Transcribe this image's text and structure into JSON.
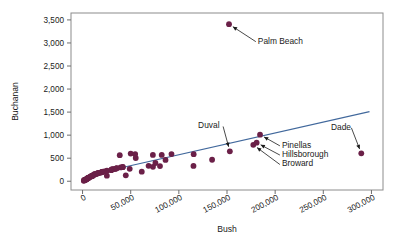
{
  "chart": {
    "type": "scatter",
    "title": "",
    "colors": {
      "point": "#6b2048",
      "trendline": "#41689c",
      "frame": "#8c8c8c",
      "text": "#1a1a1a",
      "background": "#ffffff"
    }
  },
  "chart_data": {
    "type": "scatter",
    "title": "",
    "xlabel": "Bush",
    "ylabel": "Buchanan",
    "xlim": [
      -12000,
      312000
    ],
    "ylim": [
      -190,
      3650
    ],
    "grid": false,
    "legend": null,
    "xticks": [
      0,
      50000,
      100000,
      150000,
      200000,
      250000,
      300000
    ],
    "xtick_labels": [
      "0",
      "50,000",
      "100,000",
      "150,000",
      "200,000",
      "250,000",
      "300,000"
    ],
    "yticks": [
      0,
      500,
      1000,
      1500,
      2000,
      2500,
      3000,
      3500
    ],
    "ytick_labels": [
      "0",
      "500",
      "1,000",
      "1,500",
      "2,000",
      "2,500",
      "3,000",
      "3,500"
    ],
    "series": [
      {
        "name": "Florida counties",
        "marker": "circle",
        "color": "#6b2048",
        "x": [
          1316,
          1407,
          2153,
          2873,
          3038,
          3300,
          3764,
          4051,
          4256,
          4512,
          4985,
          5058,
          5414,
          5610,
          6060,
          6443,
          7244,
          8177,
          8350,
          9138,
          9893,
          10006,
          10776,
          11249,
          12173,
          12176,
          12463,
          13439,
          14630,
          15196,
          16059,
          16404,
          17233,
          18850,
          19769,
          20196,
          20736,
          21271,
          23160,
          25249,
          25309,
          29744,
          29765,
          30400,
          31045,
          32644,
          34124,
          34705,
          35419,
          35426,
          38637,
          39497,
          41745,
          41774,
          44896,
          48969,
          50010,
          54647,
          55229,
          61483,
          68582,
          73029,
          73126,
          75677,
          80416,
          82214,
          86145,
          92359,
          115185,
          115396,
          134530,
          152082,
          152951,
          177323,
          180760,
          184312,
          289456
        ],
        "y": [
          9,
          22,
          29,
          27,
          35,
          36,
          41,
          46,
          52,
          48,
          57,
          60,
          65,
          70,
          73,
          78,
          90,
          95,
          105,
          108,
          120,
          111,
          126,
          133,
          145,
          150,
          155,
          152,
          162,
          168,
          175,
          180,
          182,
          188,
          195,
          200,
          205,
          210,
          215,
          120,
          228,
          240,
          248,
          255,
          260,
          265,
          270,
          275,
          280,
          285,
          565,
          300,
          305,
          310,
          128,
          270,
          600,
          590,
          504,
          208,
          335,
          570,
          312,
          396,
          330,
          570,
          462,
          590,
          333,
          588,
          466,
          3407,
          650,
          789,
          836,
          1010,
          605
        ]
      }
    ],
    "trendline": {
      "label": "least-squares fit",
      "color": "#41689c",
      "x": [
        38000,
        298000
      ],
      "y": [
        280,
        1510
      ]
    },
    "annotations": [
      {
        "label": "Palm Beach",
        "point_x": 152082,
        "point_y": 3407,
        "text_x": 182000,
        "text_y": 3050,
        "anchor": "start"
      },
      {
        "label": "Duval",
        "point_x": 152951,
        "point_y": 650,
        "text_x": 120000,
        "text_y": 1210,
        "anchor": "start"
      },
      {
        "label": "Pinellas",
        "point_x": 184312,
        "point_y": 1010,
        "text_x": 207000,
        "text_y": 790,
        "anchor": "start"
      },
      {
        "label": "Hillsborough",
        "point_x": 180760,
        "point_y": 836,
        "text_x": 207000,
        "text_y": 590,
        "anchor": "start"
      },
      {
        "label": "Broward",
        "point_x": 177323,
        "point_y": 789,
        "text_x": 207000,
        "text_y": 385,
        "anchor": "start"
      },
      {
        "label": "Dade",
        "point_x": 289456,
        "point_y": 605,
        "text_x": 258000,
        "text_y": 1180,
        "anchor": "start"
      }
    ]
  }
}
